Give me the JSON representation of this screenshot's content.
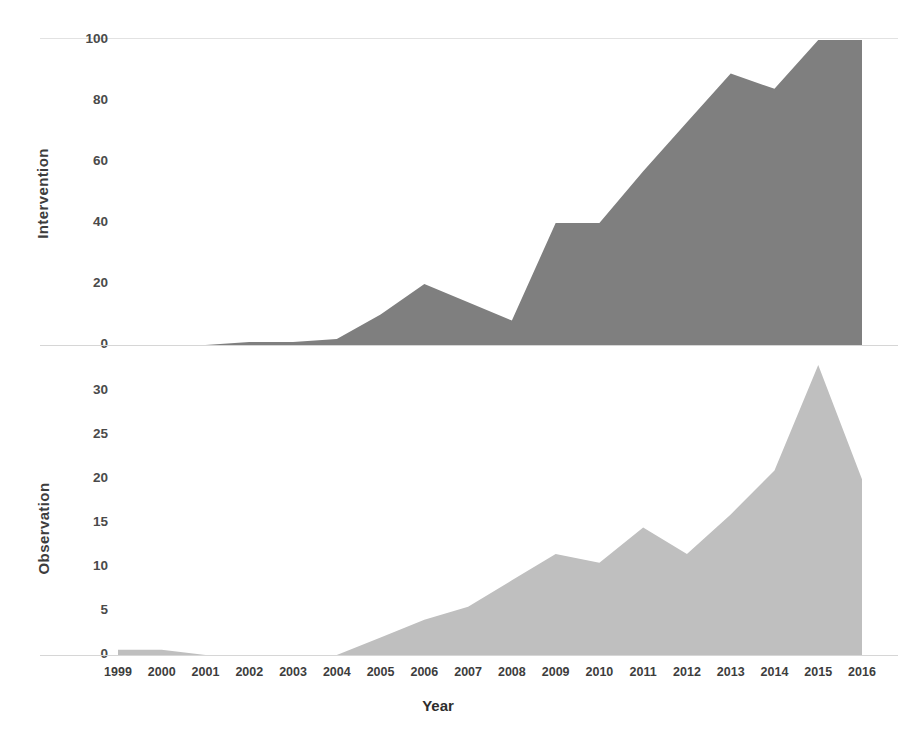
{
  "figure": {
    "background": "#ffffff",
    "xlabel": "Year",
    "panels": [
      {
        "id": "intervention",
        "ylabel": "Intervention"
      },
      {
        "id": "observation",
        "ylabel": "Observation"
      }
    ]
  },
  "chart_data": [
    {
      "type": "area",
      "title": "",
      "subtitle": "",
      "xlabel": "",
      "ylabel": "Intervention",
      "series_color": "#7f7f7f",
      "grid": false,
      "legend": "none",
      "xlim": [
        1999,
        2016
      ],
      "ylim": [
        0,
        100
      ],
      "yticks": [
        0,
        20,
        40,
        60,
        80,
        100
      ],
      "ytick_labels": [
        "0",
        "20",
        "40",
        "60",
        "80",
        "100"
      ],
      "categories": [
        1999,
        2000,
        2001,
        2002,
        2003,
        2004,
        2005,
        2006,
        2007,
        2008,
        2009,
        2010,
        2011,
        2012,
        2013,
        2014,
        2015,
        2016
      ],
      "values": [
        0,
        0,
        0,
        1,
        1,
        2,
        10,
        20,
        14,
        8,
        40,
        40,
        57,
        73,
        89,
        84,
        100,
        100
      ]
    },
    {
      "type": "area",
      "title": "",
      "subtitle": "",
      "xlabel": "Year",
      "ylabel": "Observation",
      "series_color": "#bfbfbf",
      "grid": false,
      "legend": "none",
      "xlim": [
        1999,
        2016
      ],
      "ylim": [
        0,
        33
      ],
      "yticks": [
        0,
        5,
        10,
        15,
        20,
        25,
        30
      ],
      "ytick_labels": [
        "0",
        "5",
        "10",
        "15",
        "20",
        "25",
        "30"
      ],
      "categories": [
        1999,
        2000,
        2001,
        2002,
        2003,
        2004,
        2005,
        2006,
        2007,
        2008,
        2009,
        2010,
        2011,
        2012,
        2013,
        2014,
        2015,
        2016
      ],
      "values": [
        0.6,
        0.6,
        0,
        0,
        0,
        0,
        2,
        4,
        5.5,
        8.5,
        11.5,
        10.5,
        14.5,
        11.5,
        16,
        21,
        33,
        20
      ]
    }
  ],
  "x_tick_labels": [
    "1999",
    "2000",
    "2001",
    "2002",
    "2003",
    "2004",
    "2005",
    "2006",
    "2007",
    "2008",
    "2009",
    "2010",
    "2011",
    "2012",
    "2013",
    "2014",
    "2015",
    "2016"
  ]
}
